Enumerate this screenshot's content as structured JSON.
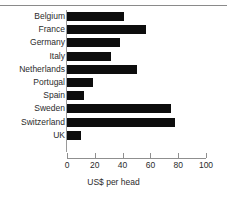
{
  "chart_data": {
    "type": "bar",
    "orientation": "horizontal",
    "title": "",
    "xlabel": "US$ per head",
    "ylabel": "",
    "categories": [
      "Belgium",
      "France",
      "Germany",
      "Italy",
      "Netherlands",
      "Portugal",
      "Spain",
      "Sweden",
      "Switzerland",
      "UK"
    ],
    "values": [
      41,
      57,
      38,
      32,
      50,
      19,
      12,
      75,
      78,
      10
    ],
    "xlim": [
      0,
      100
    ],
    "xticks": [
      0,
      20,
      40,
      60,
      80,
      100
    ],
    "xtick_labels": [
      "0",
      "20",
      "40",
      "60",
      "80",
      "100"
    ],
    "grid": false,
    "legend": null,
    "bar_color": "#0d0d0d",
    "axis_color": "#8f8f8f",
    "text_color": "#2b2b2b"
  }
}
